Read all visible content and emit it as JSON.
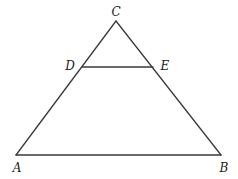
{
  "diagram": {
    "type": "triangle-with-parallel-segment",
    "points": {
      "A": {
        "label": "A",
        "x": 16,
        "y": 155,
        "label_x": 17,
        "label_y": 172
      },
      "B": {
        "label": "B",
        "x": 221,
        "y": 155,
        "label_x": 224,
        "label_y": 172
      },
      "C": {
        "label": "C",
        "x": 116,
        "y": 21,
        "label_x": 116,
        "label_y": 16
      },
      "D": {
        "label": "D",
        "x": 82,
        "y": 67,
        "label_x": 70,
        "label_y": 70
      },
      "E": {
        "label": "E",
        "x": 153,
        "y": 67,
        "label_x": 165,
        "label_y": 70
      }
    },
    "segments": [
      {
        "name": "AB",
        "from": "A",
        "to": "B"
      },
      {
        "name": "AC",
        "from": "A",
        "to": "C"
      },
      {
        "name": "BC",
        "from": "B",
        "to": "C"
      },
      {
        "name": "DE",
        "from": "D",
        "to": "E"
      }
    ],
    "stroke_color": "#3a3a3a"
  }
}
